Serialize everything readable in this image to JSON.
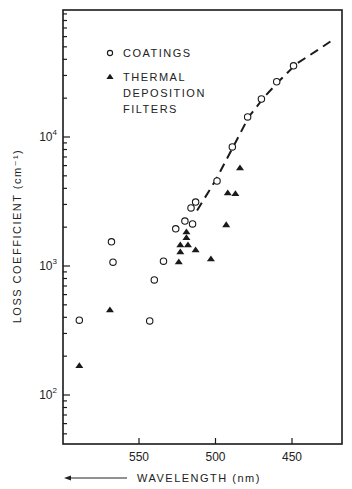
{
  "chart_data": {
    "type": "scatter",
    "title": "",
    "xlabel": "WAVELENGTH (nm)",
    "xlabel_arrow": "left",
    "ylabel": "LOSS COEFFICIENT (cm⁻¹)",
    "yscale": "log",
    "xlim": [
      600,
      417
    ],
    "ylim": [
      43,
      100000
    ],
    "x_ticks": [
      550,
      500,
      450
    ],
    "x_tick_labels": [
      "550",
      "500",
      "450"
    ],
    "y_ticks": [
      100,
      1000,
      10000
    ],
    "y_tick_labels": [
      {
        "base": "10",
        "exp": "2"
      },
      {
        "base": "10",
        "exp": "3"
      },
      {
        "base": "10",
        "exp": "4"
      }
    ],
    "grid": false,
    "legend_position": "upper-left",
    "series": [
      {
        "name": "COATINGS",
        "marker": "open-circle",
        "points": [
          {
            "x": 589,
            "y": 380
          },
          {
            "x": 568,
            "y": 1540
          },
          {
            "x": 567,
            "y": 1070
          },
          {
            "x": 543,
            "y": 375
          },
          {
            "x": 540,
            "y": 780
          },
          {
            "x": 534,
            "y": 1090
          },
          {
            "x": 526,
            "y": 1940
          },
          {
            "x": 520,
            "y": 2230
          },
          {
            "x": 515,
            "y": 2120
          },
          {
            "x": 516,
            "y": 2820
          },
          {
            "x": 513,
            "y": 3130
          },
          {
            "x": 499,
            "y": 4560
          },
          {
            "x": 489,
            "y": 8370
          },
          {
            "x": 479,
            "y": 14300
          },
          {
            "x": 470,
            "y": 19700
          },
          {
            "x": 460,
            "y": 26800
          },
          {
            "x": 449,
            "y": 35600
          }
        ]
      },
      {
        "name": "THERMAL DEPOSITION FILTERS",
        "marker": "filled-triangle",
        "points": [
          {
            "x": 589,
            "y": 168
          },
          {
            "x": 569,
            "y": 455
          },
          {
            "x": 524,
            "y": 1070
          },
          {
            "x": 523,
            "y": 1280
          },
          {
            "x": 523,
            "y": 1450
          },
          {
            "x": 518,
            "y": 1450
          },
          {
            "x": 519,
            "y": 1650
          },
          {
            "x": 519,
            "y": 1830
          },
          {
            "x": 513,
            "y": 1330
          },
          {
            "x": 503,
            "y": 1130
          },
          {
            "x": 493,
            "y": 2080
          },
          {
            "x": 492,
            "y": 3680
          },
          {
            "x": 487,
            "y": 3620
          },
          {
            "x": 484,
            "y": 5750
          }
        ]
      },
      {
        "name": "fit",
        "style": "dashed-line",
        "points": [
          {
            "x": 512,
            "y": 2700
          },
          {
            "x": 500,
            "y": 4600
          },
          {
            "x": 488,
            "y": 8600
          },
          {
            "x": 478,
            "y": 14500
          },
          {
            "x": 468,
            "y": 20500
          },
          {
            "x": 458,
            "y": 27500
          },
          {
            "x": 447,
            "y": 37000
          },
          {
            "x": 430,
            "y": 50000
          },
          {
            "x": 424,
            "y": 56000
          }
        ]
      }
    ]
  },
  "legend": {
    "items": [
      {
        "marker": "open-circle",
        "lines": [
          "COATINGS"
        ]
      },
      {
        "marker": "filled-triangle",
        "lines": [
          "THERMAL",
          "DEPOSITION",
          "FILTERS"
        ]
      }
    ]
  },
  "colors": {
    "ink": "#1a1a1a",
    "background": "#ffffff"
  }
}
